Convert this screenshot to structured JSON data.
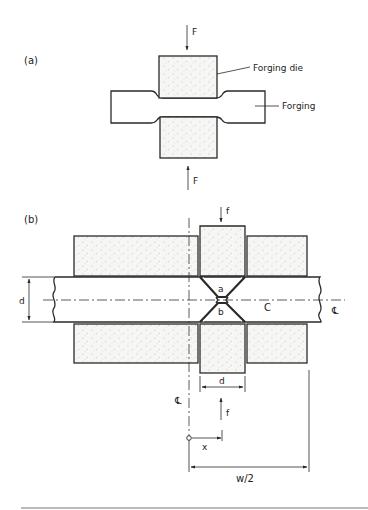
{
  "figure": {
    "panel_a": {
      "label": "(a)",
      "force_top": "F",
      "force_bottom": "F",
      "callouts": {
        "die": "Forging die",
        "workpiece": "Forging"
      }
    },
    "panel_b": {
      "label": "(b)",
      "force_top": "f",
      "force_bottom": "f",
      "region_upper": "a",
      "region_lower": "b",
      "region_right": "C",
      "bar_thickness": "d",
      "die_width": "d",
      "position": "x",
      "half_width": "w/2",
      "centerline_vertical": "℄",
      "centerline_horizontal": "℄"
    },
    "colors": {
      "line": "#2a2a2a",
      "die_fill": "#f4f4f2",
      "background": "#ffffff"
    }
  }
}
